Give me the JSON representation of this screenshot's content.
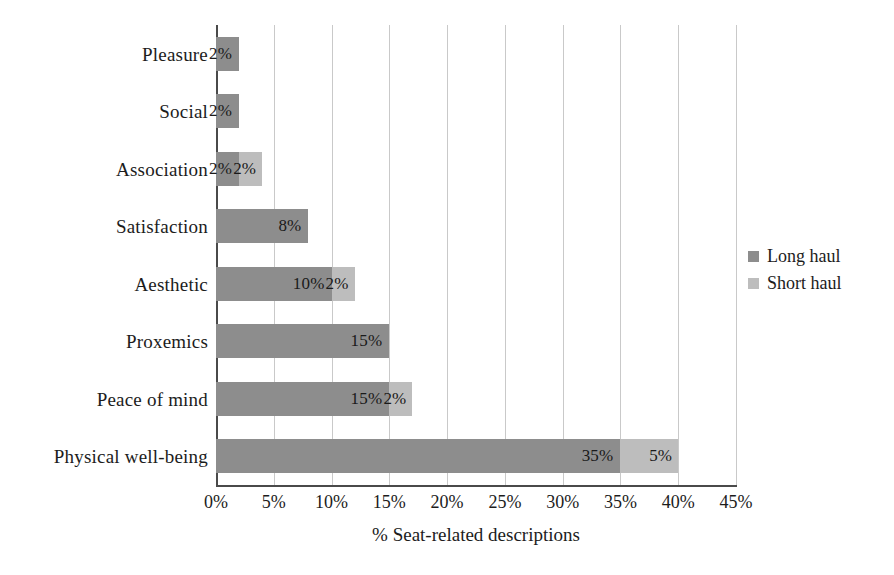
{
  "chart_data": {
    "type": "bar",
    "orientation": "horizontal",
    "stacked": true,
    "title": "",
    "xlabel": "% Seat-related descriptions",
    "ylabel": "",
    "xlim": [
      0,
      45
    ],
    "xticks": [
      "0%",
      "5%",
      "10%",
      "15%",
      "20%",
      "25%",
      "30%",
      "35%",
      "40%",
      "45%"
    ],
    "xtick_values": [
      0,
      5,
      10,
      15,
      20,
      25,
      30,
      35,
      40,
      45
    ],
    "grid": "vertical",
    "legend_position": "right",
    "categories": [
      "Pleasure",
      "Social",
      "Association",
      "Satisfaction",
      "Aesthetic",
      "Proxemics",
      "Peace of mind",
      "Physical well-being"
    ],
    "series": [
      {
        "name": "Long haul",
        "color": "#8d8d8d",
        "values": [
          2,
          2,
          2,
          8,
          10,
          15,
          15,
          35
        ],
        "labels": [
          "2%",
          "2%",
          "2%",
          "8%",
          "10%",
          "15%",
          "15%",
          "35%"
        ]
      },
      {
        "name": "Short haul",
        "color": "#bdbdbd",
        "values": [
          0,
          0,
          2,
          0,
          2,
          0,
          2,
          5
        ],
        "labels": [
          "",
          "",
          "2%",
          "",
          "2%",
          "",
          "2%",
          "5%"
        ]
      }
    ],
    "totals": [
      2,
      2,
      4,
      8,
      12,
      15,
      17,
      40
    ]
  },
  "legend": {
    "items": [
      {
        "label": "Long haul",
        "swatch": "long-haul-swatch"
      },
      {
        "label": "Short haul",
        "swatch": "short-haul-swatch"
      }
    ]
  }
}
